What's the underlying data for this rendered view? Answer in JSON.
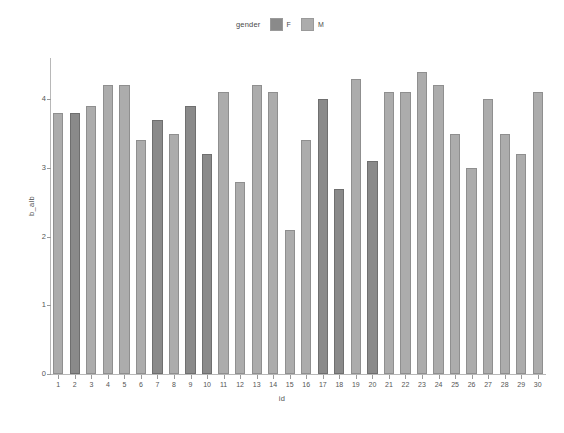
{
  "legend": {
    "title": "gender",
    "entries": [
      {
        "label": "F",
        "color": "#8a8a8a"
      },
      {
        "label": "M",
        "color": "#acacac"
      }
    ]
  },
  "axes": {
    "ylabel": "b_alb",
    "xlabel": "id",
    "yticks": [
      "0",
      "1",
      "2",
      "3",
      "4"
    ],
    "xticks": [
      "1",
      "2",
      "3",
      "4",
      "5",
      "6",
      "7",
      "8",
      "9",
      "10",
      "11",
      "12",
      "13",
      "14",
      "15",
      "16",
      "17",
      "18",
      "19",
      "20",
      "21",
      "22",
      "23",
      "24",
      "25",
      "26",
      "27",
      "28",
      "29",
      "30"
    ]
  },
  "chart_data": {
    "type": "bar",
    "title": "",
    "xlabel": "id",
    "ylabel": "b_alb",
    "ylim": [
      0,
      4.6
    ],
    "grid": false,
    "legend_title": "gender",
    "legend_position": "top-center",
    "categories": [
      "1",
      "2",
      "3",
      "4",
      "5",
      "6",
      "7",
      "8",
      "9",
      "10",
      "11",
      "12",
      "13",
      "14",
      "15",
      "16",
      "17",
      "18",
      "19",
      "20",
      "21",
      "22",
      "23",
      "24",
      "25",
      "26",
      "27",
      "28",
      "29",
      "30"
    ],
    "values": [
      3.8,
      3.8,
      3.9,
      4.2,
      4.2,
      3.4,
      3.7,
      3.5,
      3.9,
      3.2,
      4.1,
      2.8,
      4.2,
      4.1,
      2.1,
      3.4,
      4.0,
      2.7,
      4.3,
      3.1,
      4.1,
      4.1,
      4.4,
      4.2,
      3.5,
      3.0,
      4.0,
      3.5,
      3.2,
      4.1
    ],
    "groups": [
      "M",
      "F",
      "M",
      "M",
      "M",
      "M",
      "F",
      "M",
      "F",
      "F",
      "M",
      "M",
      "M",
      "M",
      "M",
      "M",
      "F",
      "F",
      "M",
      "F",
      "M",
      "M",
      "M",
      "M",
      "M",
      "M",
      "M",
      "M",
      "M",
      "M"
    ],
    "group_colors": {
      "F": "#8a8a8a",
      "M": "#acacac"
    }
  }
}
